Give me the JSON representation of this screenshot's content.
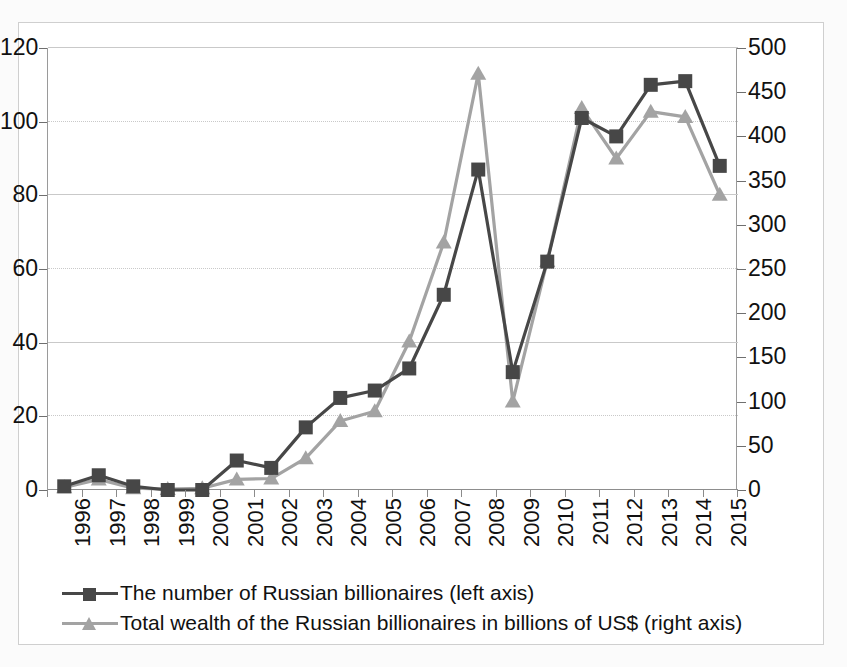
{
  "chart_data": {
    "type": "line",
    "title": "",
    "subtitle": "",
    "xlabel": "",
    "ylabel": "",
    "y2label": "",
    "grid": true,
    "legend_position": "bottom-left",
    "categories": [
      "1996",
      "1997",
      "1998",
      "1999",
      "2000",
      "2001",
      "2002",
      "2003",
      "2004",
      "2005",
      "2006",
      "2007",
      "2008",
      "2009",
      "2010",
      "2011",
      "2012",
      "2013",
      "2014",
      "2015"
    ],
    "axes": {
      "left": {
        "min": 0,
        "max": 120,
        "step": 20,
        "ticks": [
          "0",
          "20",
          "40",
          "60",
          "80",
          "100",
          "120"
        ]
      },
      "right": {
        "min": 0,
        "max": 500,
        "step": 50,
        "ticks": [
          "0",
          "50",
          "100",
          "150",
          "200",
          "250",
          "300",
          "350",
          "400",
          "450",
          "500"
        ]
      }
    },
    "series": [
      {
        "name": "The number of Russian billionaires (left axis)",
        "axis": "left",
        "marker": "square",
        "color": "#474747",
        "values": [
          1,
          4,
          1,
          0,
          0,
          8,
          6,
          17,
          25,
          27,
          33,
          53,
          87,
          32,
          62,
          101,
          96,
          110,
          111,
          88
        ]
      },
      {
        "name": "Total wealth of the Russian billionaires in billions of US$ (right axis)",
        "axis": "right",
        "marker": "triangle",
        "color": "#a3a3a3",
        "values": [
          3,
          12,
          2,
          1,
          2,
          12,
          13,
          36,
          78,
          89,
          168,
          280,
          471,
          100,
          259,
          432,
          375,
          428,
          422,
          334
        ]
      }
    ]
  },
  "legend": {
    "items": [
      {
        "label": "The number of Russian billionaires (left axis)",
        "marker": "square",
        "color": "#474747"
      },
      {
        "label": "Total wealth of the Russian billionaires in billions of US$ (right axis)",
        "marker": "triangle",
        "color": "#a3a3a3"
      }
    ]
  },
  "colors": {
    "series_dark": "#474747",
    "series_light": "#a3a3a3",
    "gridline": "#c9c9c9",
    "axis": "#8d8d8d",
    "background": "#ffffff"
  }
}
